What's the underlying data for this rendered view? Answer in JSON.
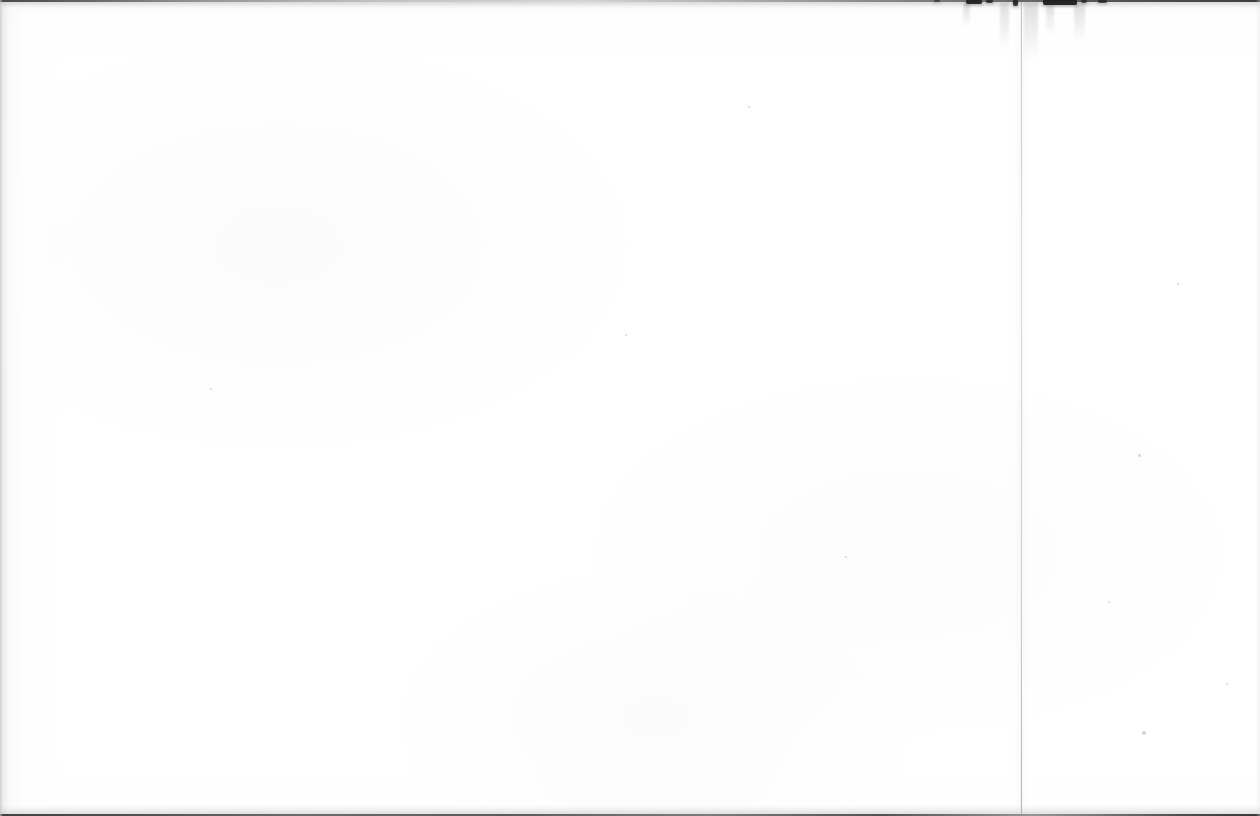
{
  "page": {
    "kind": "scanned-blank-page",
    "width": 1260,
    "height": 816,
    "content_text": "",
    "note": "Blank leaf of a scanned book; no printed text, headings, figures or page number are visible within the frame.",
    "background_color": "#ffffff",
    "ink_color": "#1b1b1d",
    "edge_color": "#3a3a3a",
    "fold_color": "#b4b4ba",
    "speck_color": "#96969c"
  },
  "artifacts": {
    "top_edge": {
      "label": "scan-edge-top",
      "y": 0,
      "height": 2,
      "description": "Thin dark horizontal scanner edge across the full width."
    },
    "bottom_edge": {
      "label": "scan-edge-bottom",
      "y": 814,
      "height": 2,
      "description": "Thin dark horizontal scanner edge across the full width."
    },
    "left_edge": {
      "label": "scan-edge-left",
      "x": 0,
      "width": 3,
      "description": "Soft grey gradient down the left margin."
    },
    "right_edge": {
      "label": "scan-edge-right",
      "x": 1256,
      "width": 4,
      "description": "Very faint grey gradient down the right margin."
    },
    "fold": {
      "label": "page-fold-crease",
      "x": 1021,
      "width": 1,
      "description": "Light vertical gutter/fold line running the full height of the page."
    },
    "ink_marks": [
      {
        "x": 966,
        "width": 16,
        "height": 4,
        "opacity": 0.95
      },
      {
        "x": 986,
        "width": 7,
        "height": 3,
        "opacity": 0.8
      },
      {
        "x": 1013,
        "width": 5,
        "height": 6,
        "opacity": 0.9
      },
      {
        "x": 1043,
        "width": 34,
        "height": 5,
        "opacity": 0.98
      },
      {
        "x": 1081,
        "width": 6,
        "height": 3,
        "opacity": 0.7
      },
      {
        "x": 1098,
        "width": 9,
        "height": 3,
        "opacity": 0.75
      },
      {
        "x": 934,
        "width": 6,
        "height": 2,
        "opacity": 0.55
      }
    ],
    "smudges": [
      {
        "x": 1000,
        "y": 2,
        "width": 9,
        "height": 46
      },
      {
        "x": 1024,
        "y": 2,
        "width": 14,
        "height": 58
      },
      {
        "x": 1046,
        "y": 2,
        "width": 8,
        "height": 34
      },
      {
        "x": 1074,
        "y": 2,
        "width": 11,
        "height": 40
      },
      {
        "x": 963,
        "y": 2,
        "width": 7,
        "height": 26
      }
    ],
    "specks": [
      {
        "x": 1138,
        "y": 454,
        "size": 3
      },
      {
        "x": 1142,
        "y": 731,
        "size": 4
      },
      {
        "x": 1108,
        "y": 601,
        "size": 2
      },
      {
        "x": 1226,
        "y": 683,
        "size": 2
      },
      {
        "x": 748,
        "y": 106,
        "size": 2
      },
      {
        "x": 210,
        "y": 388,
        "size": 2
      },
      {
        "x": 625,
        "y": 334,
        "size": 2
      },
      {
        "x": 845,
        "y": 556,
        "size": 2
      },
      {
        "x": 1177,
        "y": 283,
        "size": 2
      }
    ]
  }
}
